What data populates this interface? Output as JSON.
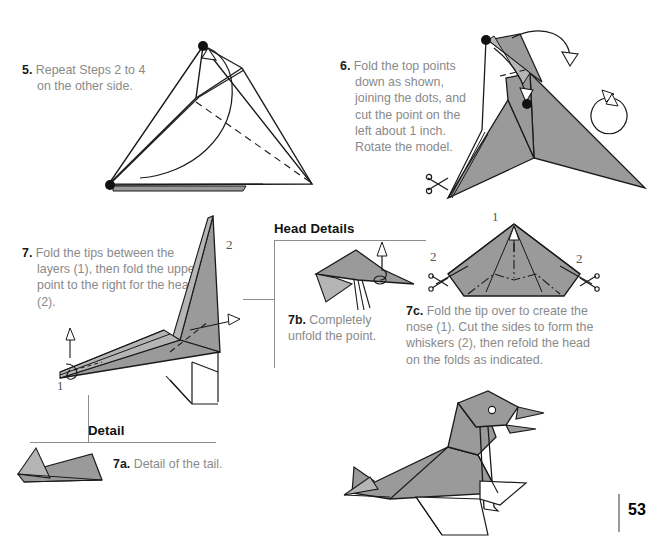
{
  "page": {
    "number": "53",
    "background_color": "#ffffff",
    "body_text_color": "#8a8a8a",
    "heading_color": "#111111",
    "paper_fill": "#9a9a9a",
    "paper_fill_light": "#b5b5b5",
    "line_color": "#1a1a1a"
  },
  "steps": [
    {
      "id": "step-5",
      "number": "5.",
      "text": "Repeat Steps 2 to 4 on the other side."
    },
    {
      "id": "step-6",
      "number": "6.",
      "text": "Fold the top points down as shown, joining the dots, and cut the point on the left about 1 inch. Rotate the model."
    },
    {
      "id": "step-7",
      "number": "7.",
      "text": "Fold the tips between the layers (1), then fold the upper point to the right for the head (2)."
    },
    {
      "id": "step-7a",
      "number": "7a.",
      "text": "Detail of the tail."
    },
    {
      "id": "step-7b",
      "number": "7b.",
      "text": "Completely unfold the point."
    },
    {
      "id": "step-7c",
      "number": "7c.",
      "text": "Fold the tip over to create the nose (1). Cut the sides to form the whiskers (2), then refold the head on the folds as indicated."
    }
  ],
  "callouts": [
    {
      "id": "head-details",
      "label": "Head Details"
    },
    {
      "id": "detail",
      "label": "Detail"
    }
  ],
  "figure_labels": {
    "step7_label_2": "2",
    "step7_label_1": "1",
    "step7c_label_1": "1",
    "step7c_label_2_left": "2",
    "step7c_label_2_right": "2"
  }
}
